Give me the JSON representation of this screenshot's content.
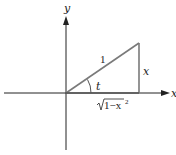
{
  "diagram": {
    "type": "right-triangle-on-axes",
    "axes": {
      "x_label": "x",
      "y_label": "y"
    },
    "triangle": {
      "hypotenuse_label": "1",
      "opposite_label": "x",
      "adjacent_label_radicand": "1−x",
      "adjacent_label_exponent": "2",
      "angle_label": "t"
    },
    "colors": {
      "axis": "#222222",
      "triangle": "#7a7a7a",
      "text": "#222222"
    }
  }
}
